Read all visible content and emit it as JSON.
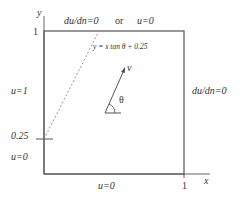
{
  "diagram": {
    "type": "boundary-value-problem-domain",
    "axes": {
      "x_label": "x",
      "y_label": "y",
      "x_tick": "1",
      "y_tick": "1",
      "y_mark": "0.25"
    },
    "boundaries": {
      "top": {
        "left_condition": "du/dn=0",
        "connector": "or",
        "right_condition": "u=0"
      },
      "right": "du/dn=0",
      "bottom": "u=0",
      "left_upper": "u=1",
      "left_lower": "u=0"
    },
    "characteristic_line": {
      "equation": "y = x tan θ + 0.25",
      "style": "dashed"
    },
    "velocity": {
      "label": "v",
      "angle_label": "θ"
    }
  },
  "colors": {
    "line": "#555555",
    "text": "#333333",
    "dashed": "#888888"
  }
}
